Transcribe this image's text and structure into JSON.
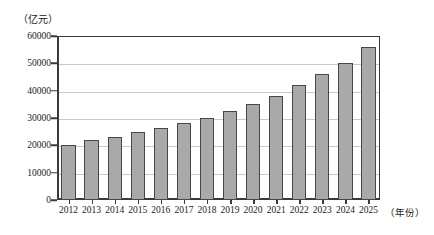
{
  "chart_data": {
    "type": "bar",
    "title": "",
    "xlabel": "（年份）",
    "ylabel": "（亿元）",
    "categories": [
      "2012",
      "2013",
      "2014",
      "2015",
      "2016",
      "2017",
      "2018",
      "2019",
      "2020",
      "2021",
      "2022",
      "2023",
      "2024",
      "2025"
    ],
    "values": [
      20000,
      22000,
      23000,
      25000,
      26500,
      28000,
      30000,
      32500,
      35000,
      38000,
      42000,
      46000,
      50000,
      56000
    ],
    "ylim": [
      0,
      60000
    ],
    "yticks": [
      0,
      10000,
      20000,
      30000,
      40000,
      50000,
      60000
    ],
    "ytick_labels": [
      "0",
      "10000",
      "20000",
      "30000",
      "40000",
      "50000",
      "60000"
    ],
    "grid": true,
    "legend": null,
    "legend_position": "none",
    "bar_color": "#a9a9a9",
    "bar_border_color": "#474747",
    "grid_color": "#c9c9c9",
    "axis_color": "#3a3a3a"
  }
}
